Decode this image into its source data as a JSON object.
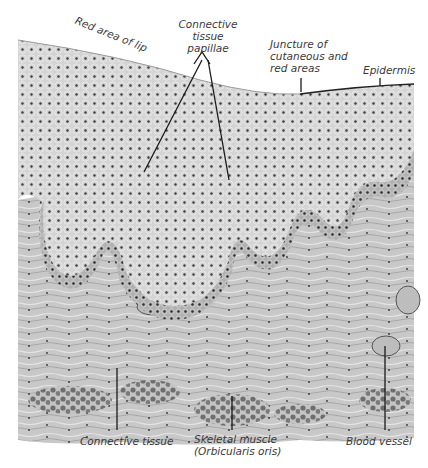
{
  "figure": {
    "colors": {
      "background": "#ffffff",
      "tissue_light": "#d9d9d9",
      "tissue_mid": "#b5b5b5",
      "tissue_dark": "#8a8a8a",
      "nuclei": "#3d3d3d",
      "leader_line": "#1a1a1a",
      "label_text": "#3a3a3a"
    }
  },
  "labels": {
    "red_area": "Red area of lip",
    "papillae": [
      "Connective",
      "tissue",
      "papillae"
    ],
    "juncture": [
      "Juncture of",
      "cutaneous and",
      "red areas"
    ],
    "epidermis": "Epidermis",
    "connective_tissue": "Connective tissue",
    "skeletal_muscle": [
      "Skeletal muscle",
      "(Orbicularis oris)"
    ],
    "blood_vessel": "Blood vessel"
  }
}
